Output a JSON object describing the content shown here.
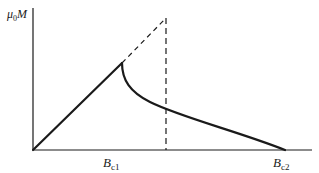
{
  "diagram": {
    "type": "magnetization-curve",
    "y_axis": {
      "label_symbol": "μ",
      "label_sub": "0",
      "label_var": "M"
    },
    "x_axis": {
      "ticks": [
        {
          "base": "B",
          "sub": "c1"
        },
        {
          "base": "B",
          "sub": "c2"
        }
      ]
    },
    "curves": [
      {
        "name": "linear-rise",
        "style": "solid"
      },
      {
        "name": "decay-to-bc2",
        "style": "solid"
      },
      {
        "name": "extrapolated-rise",
        "style": "dashed"
      },
      {
        "name": "thermodynamic-critical-field-drop",
        "style": "dashed"
      }
    ],
    "colors": {
      "line": "#1a1a1a",
      "background": "#ffffff"
    }
  }
}
